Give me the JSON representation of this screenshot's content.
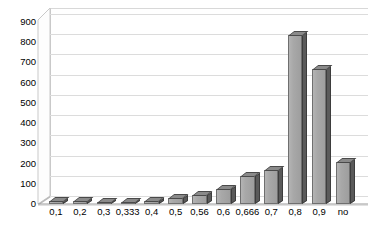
{
  "chart_data": {
    "type": "bar",
    "title": "",
    "subtitle": "",
    "xlabel": "",
    "ylabel": "",
    "categories": [
      "0,1",
      "0,2",
      "0,3",
      "0,333",
      "0,4",
      "0,5",
      "0,56",
      "0,6",
      "0,666",
      "0,7",
      "0,8",
      "0,9",
      "no"
    ],
    "values": [
      14,
      13,
      10,
      9,
      16,
      30,
      45,
      75,
      140,
      170,
      835,
      670,
      210
    ],
    "series": [
      {
        "name": "Series 1",
        "values": [
          14,
          13,
          10,
          9,
          16,
          30,
          45,
          75,
          140,
          170,
          835,
          670,
          210
        ]
      }
    ],
    "ylim": [
      0,
      900
    ],
    "ytick_labels": [
      "0",
      "100",
      "200",
      "300",
      "400",
      "500",
      "600",
      "700",
      "800",
      "900"
    ],
    "ytick_values": [
      0,
      100,
      200,
      300,
      400,
      500,
      600,
      700,
      800,
      900
    ],
    "grid": true,
    "legend": false,
    "legend_position": "none",
    "style": "3d-column",
    "colors": {
      "bar_front": "#a8a8a8",
      "bar_side": "#5a5a5a",
      "bar_top": "#8a8a8a",
      "bar_outline": "#6f6f6f",
      "gridline": "#dcdcdc",
      "plot_background": "#ffffff",
      "axis_text": "#000000"
    }
  }
}
